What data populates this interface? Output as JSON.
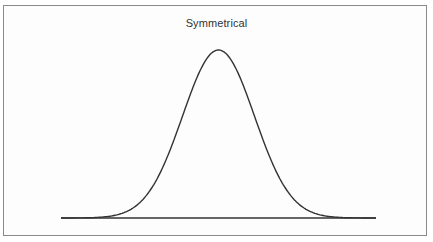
{
  "diagram": {
    "title": "Symmetrical",
    "shape": "bell-curve",
    "colors": {
      "frame": "#8a8a8a",
      "curve": "#333333",
      "text": "#333333"
    }
  },
  "chart_data": {
    "type": "line",
    "title": "Symmetrical",
    "xlabel": "",
    "ylabel": "",
    "grid": false,
    "legend": null,
    "series": [
      {
        "name": "distribution",
        "x": [
          -3,
          -2.5,
          -2,
          -1.5,
          -1,
          -0.5,
          0,
          0.5,
          1,
          1.5,
          2,
          2.5,
          3
        ],
        "values": [
          0.011,
          0.044,
          0.135,
          0.325,
          0.607,
          0.882,
          1.0,
          0.882,
          0.607,
          0.325,
          0.135,
          0.044,
          0.011
        ]
      }
    ]
  }
}
